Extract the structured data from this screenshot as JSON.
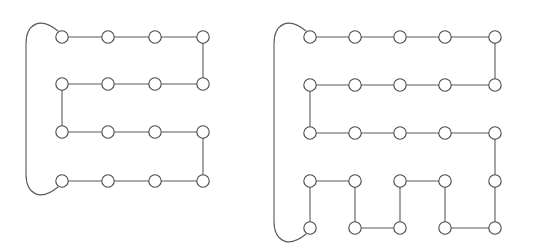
{
  "figure": {
    "name": "two-snake-path-graphs",
    "background_color": "#ffffff",
    "edge_color": "#5a5a5a",
    "node_fill": "#ffffff",
    "node_stroke": "#4a4a4a",
    "node_radius": 6.2,
    "stroke_width": 1.1,
    "panels": [
      {
        "id": "left-graph",
        "label": "left-serpentine-graph",
        "grid_columns": 4,
        "grid_rows": 4,
        "node_count": 16,
        "nodes": [
          {
            "id": "L-r1c1",
            "x": 62,
            "y": 37
          },
          {
            "id": "L-r1c2",
            "x": 108,
            "y": 37
          },
          {
            "id": "L-r1c3",
            "x": 155,
            "y": 37
          },
          {
            "id": "L-r1c4",
            "x": 203,
            "y": 37
          },
          {
            "id": "L-r2c1",
            "x": 62,
            "y": 84
          },
          {
            "id": "L-r2c2",
            "x": 108,
            "y": 84
          },
          {
            "id": "L-r2c3",
            "x": 155,
            "y": 84
          },
          {
            "id": "L-r2c4",
            "x": 203,
            "y": 84
          },
          {
            "id": "L-r3c1",
            "x": 62,
            "y": 132
          },
          {
            "id": "L-r3c2",
            "x": 108,
            "y": 132
          },
          {
            "id": "L-r3c3",
            "x": 155,
            "y": 132
          },
          {
            "id": "L-r3c4",
            "x": 203,
            "y": 132
          },
          {
            "id": "L-r4c1",
            "x": 62,
            "y": 181
          },
          {
            "id": "L-r4c2",
            "x": 108,
            "y": 181
          },
          {
            "id": "L-r4c3",
            "x": 155,
            "y": 181
          },
          {
            "id": "L-r4c4",
            "x": 203,
            "y": 181
          }
        ],
        "straight_edges": [
          [
            "L-r1c1",
            "L-r1c2"
          ],
          [
            "L-r1c2",
            "L-r1c3"
          ],
          [
            "L-r1c3",
            "L-r1c4"
          ],
          [
            "L-r1c4",
            "L-r2c4"
          ],
          [
            "L-r2c4",
            "L-r2c3"
          ],
          [
            "L-r2c3",
            "L-r2c2"
          ],
          [
            "L-r2c2",
            "L-r2c1"
          ],
          [
            "L-r2c1",
            "L-r3c1"
          ],
          [
            "L-r3c1",
            "L-r3c2"
          ],
          [
            "L-r3c2",
            "L-r3c3"
          ],
          [
            "L-r3c3",
            "L-r3c4"
          ],
          [
            "L-r3c4",
            "L-r4c4"
          ],
          [
            "L-r4c4",
            "L-r4c3"
          ],
          [
            "L-r4c3",
            "L-r4c2"
          ],
          [
            "L-r4c2",
            "L-r4c1"
          ]
        ],
        "wrap_edge": {
          "from": "L-r1c1",
          "to": "L-r4c1",
          "description": "long rounded bracket connecting top-left node to bottom-left node",
          "path": "M 58 31 C 40 16, 26 24, 26 44 L 26 174 C 26 194, 40 202, 58 187"
        }
      },
      {
        "id": "right-graph",
        "label": "right-serpentine-graph-with-zigzag-tail",
        "grid_columns": 5,
        "grid_rows": 5,
        "node_count": 25,
        "nodes": [
          {
            "id": "R-r1c1",
            "x": 310,
            "y": 37
          },
          {
            "id": "R-r1c2",
            "x": 355,
            "y": 37
          },
          {
            "id": "R-r1c3",
            "x": 400,
            "y": 37
          },
          {
            "id": "R-r1c4",
            "x": 445,
            "y": 37
          },
          {
            "id": "R-r1c5",
            "x": 495,
            "y": 37
          },
          {
            "id": "R-r2c1",
            "x": 310,
            "y": 85
          },
          {
            "id": "R-r2c2",
            "x": 355,
            "y": 85
          },
          {
            "id": "R-r2c3",
            "x": 400,
            "y": 85
          },
          {
            "id": "R-r2c4",
            "x": 445,
            "y": 85
          },
          {
            "id": "R-r2c5",
            "x": 495,
            "y": 85
          },
          {
            "id": "R-r3c1",
            "x": 310,
            "y": 133
          },
          {
            "id": "R-r3c2",
            "x": 355,
            "y": 133
          },
          {
            "id": "R-r3c3",
            "x": 400,
            "y": 133
          },
          {
            "id": "R-r3c4",
            "x": 445,
            "y": 133
          },
          {
            "id": "R-r3c5",
            "x": 495,
            "y": 133
          },
          {
            "id": "R-r4c1",
            "x": 310,
            "y": 181
          },
          {
            "id": "R-r4c2",
            "x": 355,
            "y": 181
          },
          {
            "id": "R-r4c3",
            "x": 400,
            "y": 181
          },
          {
            "id": "R-r4c4",
            "x": 445,
            "y": 181
          },
          {
            "id": "R-r4c5",
            "x": 495,
            "y": 181
          },
          {
            "id": "R-r5c1",
            "x": 310,
            "y": 228
          },
          {
            "id": "R-r5c2",
            "x": 355,
            "y": 228
          },
          {
            "id": "R-r5c3",
            "x": 400,
            "y": 228
          },
          {
            "id": "R-r5c4",
            "x": 445,
            "y": 228
          },
          {
            "id": "R-r5c5",
            "x": 495,
            "y": 228
          }
        ],
        "straight_edges": [
          [
            "R-r1c1",
            "R-r1c2"
          ],
          [
            "R-r1c2",
            "R-r1c3"
          ],
          [
            "R-r1c3",
            "R-r1c4"
          ],
          [
            "R-r1c4",
            "R-r1c5"
          ],
          [
            "R-r1c5",
            "R-r2c5"
          ],
          [
            "R-r2c5",
            "R-r2c4"
          ],
          [
            "R-r2c4",
            "R-r2c3"
          ],
          [
            "R-r2c3",
            "R-r2c2"
          ],
          [
            "R-r2c2",
            "R-r2c1"
          ],
          [
            "R-r2c1",
            "R-r3c1"
          ],
          [
            "R-r3c1",
            "R-r3c2"
          ],
          [
            "R-r3c2",
            "R-r3c3"
          ],
          [
            "R-r3c3",
            "R-r3c4"
          ],
          [
            "R-r3c4",
            "R-r3c5"
          ],
          [
            "R-r3c5",
            "R-r4c5"
          ],
          [
            "R-r4c5",
            "R-r5c5"
          ],
          [
            "R-r5c5",
            "R-r5c4"
          ],
          [
            "R-r5c4",
            "R-r4c4"
          ],
          [
            "R-r4c4",
            "R-r4c3"
          ],
          [
            "R-r4c3",
            "R-r5c3"
          ],
          [
            "R-r5c3",
            "R-r5c2"
          ],
          [
            "R-r5c2",
            "R-r4c2"
          ],
          [
            "R-r4c2",
            "R-r4c1"
          ],
          [
            "R-r4c1",
            "R-r5c1"
          ]
        ],
        "wrap_edge": {
          "from": "R-r1c1",
          "to": "R-r5c1",
          "description": "long rounded bracket connecting top-left node to bottom-left node",
          "path": "M 306 31 C 288 16, 274 24, 274 44 L 274 221 C 274 241, 288 249, 306 234"
        }
      }
    ]
  }
}
